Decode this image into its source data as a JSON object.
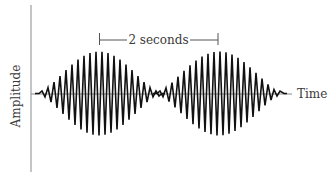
{
  "chart_data": {
    "type": "line",
    "title": "",
    "xlabel": "Time",
    "ylabel": "Amplitude",
    "grid": false,
    "legend": null,
    "annotations": [
      {
        "text": "2 seconds",
        "type": "period-bracket",
        "from_packet_peak": 1,
        "to_packet_peak": 2
      }
    ],
    "packets": [
      {
        "index": 1,
        "center_x_px": 99,
        "half_width_px": 60,
        "peak_amplitude_px": 42
      },
      {
        "index": 2,
        "center_x_px": 219,
        "half_width_px": 62,
        "peak_amplitude_px": 42
      }
    ],
    "carrier_period_px": 6,
    "period_seconds": 2
  },
  "labels": {
    "y_axis": "Amplitude",
    "x_axis": "Time",
    "period": "2 seconds"
  },
  "colors": {
    "wave": "#111111",
    "axis": "#8a8a8a",
    "text": "#3a3a3a"
  }
}
